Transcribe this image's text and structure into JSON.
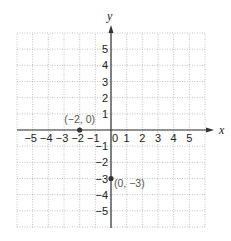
{
  "chart_data": {
    "type": "scatter",
    "title": "",
    "xlabel": "x",
    "ylabel": "y",
    "xlim": [
      -6,
      6
    ],
    "ylim": [
      -6,
      6
    ],
    "grid": true,
    "grid_style": "dotted",
    "x_ticks": [
      -5,
      -4,
      -3,
      -2,
      -1,
      0,
      1,
      2,
      3,
      4,
      5
    ],
    "x_tick_labels": [
      "−5",
      "−4",
      "−3",
      "−2",
      "−1",
      "0",
      "1",
      "2",
      "3",
      "4",
      "5"
    ],
    "y_ticks": [
      5,
      4,
      3,
      2,
      1,
      -1,
      -2,
      -3,
      -4,
      -5
    ],
    "y_tick_labels": [
      "5",
      "4",
      "3",
      "2",
      "1",
      "−1",
      "−2",
      "−3",
      "−4",
      "−5"
    ],
    "points": [
      {
        "x": -2,
        "y": 0,
        "label": "(−2, 0)"
      },
      {
        "x": 0,
        "y": -3,
        "label": "(0, −3)"
      }
    ],
    "colors": {
      "axis": "#333333",
      "grid": "#b0b0b0",
      "point": "#333333",
      "point_label": "#555555"
    }
  }
}
